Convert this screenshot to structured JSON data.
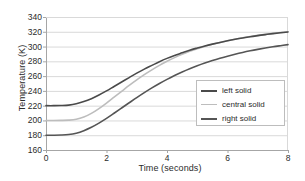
{
  "chart_data": {
    "type": "line",
    "title": "",
    "xlabel": "Time (seconds)",
    "ylabel": "Temperature (K)",
    "xlim": [
      0,
      8
    ],
    "ylim": [
      160,
      340
    ],
    "xticks": [
      "0",
      "2",
      "4",
      "6",
      "8"
    ],
    "yticks": [
      "160",
      "180",
      "200",
      "220",
      "240",
      "260",
      "280",
      "300",
      "320",
      "340"
    ],
    "grid": "horizontal",
    "legend_position": "lower-right-inside",
    "x": [
      0,
      0.25,
      0.5,
      0.75,
      1,
      1.25,
      1.5,
      1.75,
      2,
      2.25,
      2.5,
      2.75,
      3,
      3.25,
      3.5,
      3.75,
      4,
      4.25,
      4.5,
      4.75,
      5,
      5.25,
      5.5,
      5.75,
      6,
      6.25,
      6.5,
      6.75,
      7,
      7.25,
      7.5,
      7.75,
      8
    ],
    "series": [
      {
        "name": "left solid",
        "color": "#4a4a4a",
        "width": 1.6,
        "values": [
          220,
          220,
          220.2,
          220.8,
          222.5,
          225.5,
          229.5,
          234.5,
          240,
          246,
          252,
          258,
          264,
          269.5,
          274.5,
          279.5,
          284,
          288,
          291.5,
          295,
          298,
          300.8,
          303.3,
          305.6,
          307.8,
          309.8,
          311.6,
          313.2,
          314.8,
          316.2,
          317.5,
          318.7,
          319.8
        ]
      },
      {
        "name": "central solid",
        "color": "#bdbdbd",
        "width": 1.6,
        "values": [
          200,
          200,
          200.1,
          200.4,
          201.5,
          204.5,
          209.5,
          216,
          223.5,
          231.5,
          239.5,
          247.5,
          255,
          262,
          268.5,
          274.5,
          280,
          285,
          289.5,
          293.5,
          297,
          300.2,
          303,
          305.6,
          307.9,
          310,
          311.9,
          313.6,
          315.1,
          316.5,
          317.8,
          319,
          320
        ]
      },
      {
        "name": "right solid",
        "color": "#555555",
        "width": 1.6,
        "values": [
          180,
          180,
          180.2,
          180.9,
          182.8,
          186.2,
          190.8,
          196.4,
          202.8,
          209.7,
          216.8,
          223.9,
          230.9,
          237.6,
          244,
          250,
          255.6,
          260.8,
          265.6,
          270,
          274,
          277.7,
          281.1,
          284.2,
          287,
          289.6,
          292,
          294.2,
          296.2,
          298,
          299.7,
          301.2,
          302.6
        ]
      }
    ],
    "series_upper_end_note": "left solid ends ~321, central solid ends ~318, right solid ends ~314"
  },
  "legend": {
    "items": [
      {
        "label": "left solid",
        "color": "#4a4a4a"
      },
      {
        "label": "central solid",
        "color": "#bdbdbd"
      },
      {
        "label": "right solid",
        "color": "#555555"
      }
    ]
  },
  "colors": {
    "grid": "#d9d9d9",
    "axis": "#a6a6a6",
    "text": "#2b2b2b",
    "background": "#ffffff",
    "legend_border": "#bdbdbd"
  }
}
